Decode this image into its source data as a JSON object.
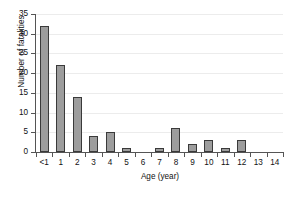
{
  "chart_data": {
    "type": "bar",
    "title": "",
    "xlabel": "Age (year)",
    "ylabel": "Number of fatalities",
    "categories": [
      "<1",
      "1",
      "2",
      "3",
      "4",
      "5",
      "6",
      "7",
      "8",
      "9",
      "10",
      "11",
      "12",
      "13",
      "14"
    ],
    "values": [
      32,
      22,
      14,
      4,
      5,
      1,
      0,
      1,
      6,
      2,
      3,
      1,
      3,
      0,
      0
    ],
    "ylim": [
      0,
      35
    ],
    "yticks": [
      0,
      5,
      10,
      15,
      20,
      25,
      30,
      35
    ],
    "ytick_labels": [
      "0",
      "5",
      "10",
      "15",
      "20",
      "25",
      "30",
      "35"
    ],
    "grid": "horizontal",
    "legend": "none",
    "bar_color": "#9d9d9d",
    "bar_edge_color": "#3a3a3a",
    "axis_color": "#555555",
    "gridline_color": "#ececec",
    "background": "#ffffff"
  },
  "caption": ""
}
